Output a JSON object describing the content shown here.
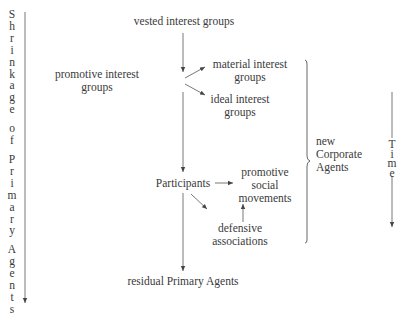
{
  "diagram": {
    "left_axis": {
      "label_letters": [
        "S",
        "h",
        "r",
        "i",
        "n",
        "k",
        "a",
        "g",
        "e",
        "",
        "o",
        "f",
        "",
        "P",
        "r",
        "i",
        "m",
        "a",
        "r",
        "y",
        "",
        "A",
        "g",
        "e",
        "n",
        "t",
        "s"
      ],
      "label": "Shrinkage of Primary Agents"
    },
    "right_axis": {
      "label_letters": [
        "T",
        "i",
        "m",
        "e"
      ],
      "label": "Time"
    },
    "nodes": {
      "vested": "vested interest groups",
      "promotive_interest_1": "promotive interest",
      "promotive_interest_2": "groups",
      "material_1": "material interest",
      "material_2": "groups",
      "ideal_1": "ideal interest",
      "ideal_2": "groups",
      "participants": "Participants",
      "promotive_social_1": "promotive",
      "promotive_social_2": "social",
      "promotive_social_3": "movements",
      "defensive_1": "defensive",
      "defensive_2": "associations",
      "residual": "residual Primary Agents",
      "new_corporate_1": "new",
      "new_corporate_2": "Corporate",
      "new_corporate_3": "Agents"
    }
  }
}
